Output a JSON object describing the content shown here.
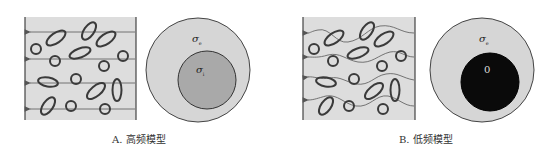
{
  "figure": {
    "panels": [
      {
        "id": "A",
        "caption": "A. 高频模型",
        "current_paths": "straight",
        "outer_label": "σ",
        "outer_sub": "e",
        "inner_label": "σ",
        "inner_sub": "i",
        "inner_fill": "#a9a9a9"
      },
      {
        "id": "B",
        "caption": "B. 低频模型",
        "current_paths": "wavy",
        "outer_label": "σ",
        "outer_sub": "e",
        "inner_label": "0",
        "inner_fill": "#0a0a0a"
      }
    ],
    "colors": {
      "background": "#ffffff",
      "medium_fill": "#dcdcdc",
      "outer_circle_fill": "#d6d6d6",
      "stroke": "#444444",
      "current_line": "#666666"
    }
  }
}
